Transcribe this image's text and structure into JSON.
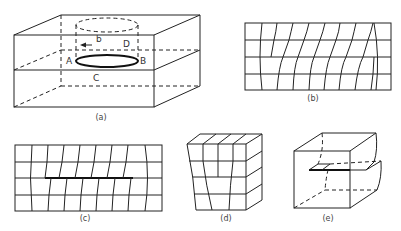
{
  "figure": {
    "panels": [
      {
        "id": "a",
        "caption": "(a)",
        "labels": {
          "A": "A",
          "B": "B",
          "C": "C",
          "D": "D",
          "b": "b"
        }
      },
      {
        "id": "b",
        "caption": "(b)"
      },
      {
        "id": "c",
        "caption": "(c)"
      },
      {
        "id": "d",
        "caption": "(d)"
      },
      {
        "id": "e",
        "caption": "(e)"
      }
    ]
  },
  "colors": {
    "line": "#222222",
    "background": "#ffffff"
  }
}
